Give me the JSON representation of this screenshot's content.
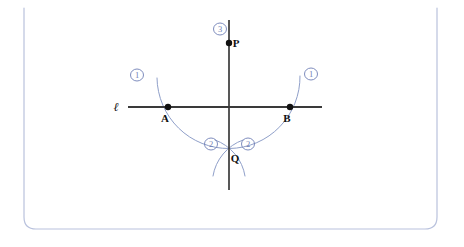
{
  "figure": {
    "frame": {
      "name": "rounded-border-frame",
      "color": "#b9c2dd",
      "left": 24,
      "right": 437,
      "bottom": 229,
      "corner_radius": 12
    },
    "colors": {
      "construction_arc": "#8f9fc9",
      "ink_line": "#3a3a3a",
      "point_fill": "#111111",
      "step_label": "#6f7fb5",
      "frame": "#b9c2dd",
      "background": "#ffffff"
    },
    "points": [
      {
        "name": "P",
        "label": "P",
        "x": 229,
        "y": 43,
        "label_dx": 7,
        "label_dy": 4,
        "radius": 3.2
      },
      {
        "name": "A",
        "label": "A",
        "x": 168,
        "y": 107,
        "label_dx": -3,
        "label_dy": 15,
        "radius": 3.2
      },
      {
        "name": "B",
        "label": "B",
        "x": 290,
        "y": 107,
        "label_dx": -3,
        "label_dy": 15,
        "radius": 3.2
      },
      {
        "name": "Q",
        "label": "Q",
        "x": 229,
        "y": 155,
        "label_dx": 6,
        "label_dy": 7,
        "radius": 0
      }
    ],
    "lines": [
      {
        "name": "line-ell",
        "label": "ℓ",
        "x1": 128,
        "y1": 107,
        "x2": 322,
        "y2": 107,
        "label_x": 116,
        "label_y": 111,
        "width": 1.9
      },
      {
        "name": "line-pq-perpendicular",
        "label": "",
        "x1": 229,
        "y1": 20,
        "x2": 229,
        "y2": 190,
        "label_x": 0,
        "label_y": 0,
        "width": 1.7
      }
    ],
    "arcs": [
      {
        "name": "arc-centered-at-P",
        "step": "1",
        "path": "M 157 78 A 68 68 0 0 0 300 76",
        "description": "arc centered at P with radius through A and B"
      },
      {
        "name": "arc-from-A",
        "step": "2",
        "path": "M 215 140 A 46 46 0 0 1 245 176",
        "description": "arc centered at A crossing below line"
      },
      {
        "name": "arc-from-B",
        "step": "2",
        "path": "M 243 140 A 46 46 0 0 0 213 176",
        "description": "arc centered at B crossing below line"
      }
    ],
    "step_labels": [
      {
        "name": "step-1-left",
        "text": "1",
        "x": 137,
        "y": 75,
        "rx": 6.5,
        "ry": 6.0
      },
      {
        "name": "step-1-right",
        "text": "1",
        "x": 311,
        "y": 74,
        "rx": 6.5,
        "ry": 6.0
      },
      {
        "name": "step-2-left",
        "text": "2",
        "x": 211,
        "y": 144,
        "rx": 6.5,
        "ry": 6.0
      },
      {
        "name": "step-2-right",
        "text": "2",
        "x": 248,
        "y": 144,
        "rx": 6.5,
        "ry": 6.0
      },
      {
        "name": "step-3-top",
        "text": "3",
        "x": 220,
        "y": 29,
        "rx": 6.5,
        "ry": 6.0
      }
    ]
  }
}
